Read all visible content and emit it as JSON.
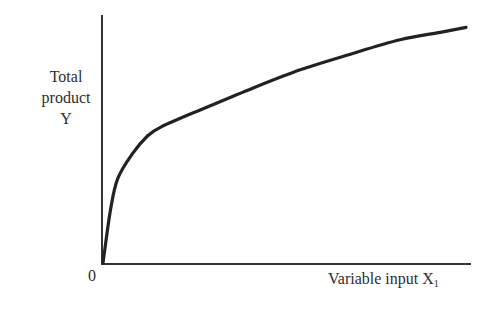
{
  "chart_data": {
    "type": "line",
    "title": "",
    "xlabel": "Variable input X1",
    "ylabel": "Total product Y",
    "ylabel_lines": [
      "Total",
      "product",
      "Y"
    ],
    "xlabel_main": "Variable input X",
    "xlabel_subscript": "1",
    "origin_label": "0",
    "grid": false,
    "legend": null,
    "xlim": [
      0,
      100
    ],
    "ylim": [
      0,
      100
    ],
    "ticks": "none",
    "series": [
      {
        "name": "Total product curve",
        "description": "Concave total product curve rising steeply from origin then flattening (diminishing marginal returns)",
        "x": [
          0,
          2,
          4,
          8,
          12,
          16,
          27,
          40,
          54,
          67,
          81,
          92,
          99
        ],
        "y": [
          0,
          21,
          34,
          44,
          51,
          55,
          62,
          70,
          78,
          84,
          90,
          93,
          95
        ]
      }
    ],
    "colors": {
      "line": "#222222",
      "axes": "#333333",
      "background": "#ffffff"
    }
  }
}
